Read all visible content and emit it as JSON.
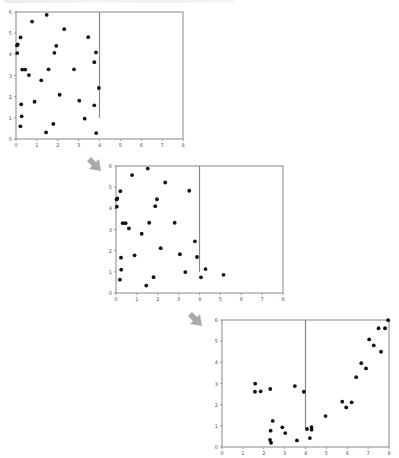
{
  "figure": {
    "arrow_color": "#aaaaaa",
    "frame_color": "#888888",
    "point_color": "#111111",
    "line_color": "#888888"
  },
  "chart_data": [
    {
      "type": "scatter",
      "title": "",
      "xlabel": "",
      "ylabel": "",
      "xlim": [
        0,
        8
      ],
      "ylim": [
        0,
        6
      ],
      "xticks": [
        "0",
        "1",
        "2",
        "3",
        "4",
        "5",
        "6",
        "7",
        "8"
      ],
      "yticks": [
        "0",
        "1",
        "2",
        "3",
        "4",
        "5",
        "6"
      ],
      "grid": false,
      "vline": {
        "x": 4,
        "y_from": 1.0,
        "y_to": 6
      },
      "points": [
        [
          1.47,
          5.86
        ],
        [
          0.77,
          5.55
        ],
        [
          2.31,
          5.19
        ],
        [
          0.22,
          4.8
        ],
        [
          3.46,
          4.81
        ],
        [
          0.08,
          4.47
        ],
        [
          0.05,
          4.42
        ],
        [
          1.93,
          4.4
        ],
        [
          0.06,
          4.06
        ],
        [
          1.84,
          4.07
        ],
        [
          3.83,
          4.09
        ],
        [
          3.75,
          3.63
        ],
        [
          0.3,
          3.28
        ],
        [
          0.44,
          3.28
        ],
        [
          1.56,
          3.29
        ],
        [
          2.78,
          3.29
        ],
        [
          0.62,
          3.02
        ],
        [
          1.21,
          2.77
        ],
        [
          3.97,
          2.41
        ],
        [
          2.09,
          2.09
        ],
        [
          0.89,
          1.76
        ],
        [
          3.03,
          1.81
        ],
        [
          0.25,
          1.64
        ],
        [
          3.75,
          1.59
        ],
        [
          0.27,
          1.07
        ],
        [
          3.29,
          0.96
        ],
        [
          0.21,
          0.6
        ],
        [
          1.79,
          0.71
        ],
        [
          1.44,
          0.31
        ],
        [
          3.84,
          0.28
        ]
      ]
    },
    {
      "type": "scatter",
      "title": "",
      "xlabel": "",
      "ylabel": "",
      "xlim": [
        0,
        8
      ],
      "ylim": [
        0,
        6
      ],
      "xticks": [
        "0",
        "1",
        "2",
        "3",
        "4",
        "5",
        "6",
        "7",
        "8"
      ],
      "yticks": [
        "0",
        "1",
        "2",
        "3",
        "4",
        "5",
        "6"
      ],
      "grid": false,
      "vline": {
        "x": 4,
        "y_from": 1.0,
        "y_to": 6
      },
      "points": [
        [
          1.52,
          5.88
        ],
        [
          0.77,
          5.57
        ],
        [
          2.36,
          5.22
        ],
        [
          0.21,
          4.81
        ],
        [
          3.51,
          4.83
        ],
        [
          0.06,
          4.47
        ],
        [
          0.03,
          4.42
        ],
        [
          1.96,
          4.43
        ],
        [
          0.04,
          4.08
        ],
        [
          1.88,
          4.1
        ],
        [
          0.32,
          3.3
        ],
        [
          0.46,
          3.3
        ],
        [
          1.59,
          3.32
        ],
        [
          2.81,
          3.32
        ],
        [
          0.62,
          3.05
        ],
        [
          1.23,
          2.8
        ],
        [
          3.78,
          2.44
        ],
        [
          2.14,
          2.12
        ],
        [
          0.89,
          1.78
        ],
        [
          3.06,
          1.83
        ],
        [
          0.24,
          1.67
        ],
        [
          3.88,
          1.7
        ],
        [
          4.29,
          1.13
        ],
        [
          0.25,
          1.1
        ],
        [
          3.32,
          0.99
        ],
        [
          5.15,
          0.86
        ],
        [
          4.07,
          0.74
        ],
        [
          1.8,
          0.75
        ],
        [
          0.19,
          0.63
        ],
        [
          1.45,
          0.35
        ]
      ]
    },
    {
      "type": "scatter",
      "title": "",
      "xlabel": "",
      "ylabel": "",
      "xlim": [
        0,
        8
      ],
      "ylim": [
        0,
        6
      ],
      "xticks": [
        "0",
        "1",
        "2",
        "3",
        "4",
        "5",
        "6",
        "7",
        "8"
      ],
      "yticks": [
        "0",
        "1",
        "2",
        "3",
        "4",
        "5",
        "6"
      ],
      "grid": false,
      "vline": {
        "x": 4,
        "y_from": 0.91,
        "y_to": 6
      },
      "points": [
        [
          7.96,
          5.99
        ],
        [
          7.5,
          5.61
        ],
        [
          7.81,
          5.61
        ],
        [
          7.05,
          5.08
        ],
        [
          7.27,
          4.8
        ],
        [
          7.62,
          4.5
        ],
        [
          6.67,
          3.96
        ],
        [
          6.9,
          3.71
        ],
        [
          6.43,
          3.3
        ],
        [
          1.59,
          2.99
        ],
        [
          3.49,
          2.88
        ],
        [
          2.31,
          2.74
        ],
        [
          1.58,
          2.61
        ],
        [
          1.85,
          2.63
        ],
        [
          3.92,
          2.61
        ],
        [
          5.76,
          2.14
        ],
        [
          6.21,
          2.11
        ],
        [
          5.95,
          1.87
        ],
        [
          4.96,
          1.46
        ],
        [
          2.43,
          1.23
        ],
        [
          2.89,
          0.93
        ],
        [
          4.29,
          0.94
        ],
        [
          4.07,
          0.85
        ],
        [
          4.29,
          0.82
        ],
        [
          2.33,
          0.77
        ],
        [
          3.03,
          0.66
        ],
        [
          4.21,
          0.42
        ],
        [
          2.3,
          0.34
        ],
        [
          3.59,
          0.31
        ],
        [
          2.35,
          0.2
        ]
      ]
    }
  ],
  "layout": {
    "panels": [
      {
        "left": 16,
        "top": 12,
        "width": 167,
        "height": 127
      },
      {
        "left": 116,
        "top": 166,
        "width": 167,
        "height": 127
      },
      {
        "left": 222,
        "top": 320,
        "width": 167,
        "height": 127
      }
    ],
    "arrows": [
      {
        "left": 86,
        "top": 156
      },
      {
        "left": 187,
        "top": 311
      }
    ]
  }
}
